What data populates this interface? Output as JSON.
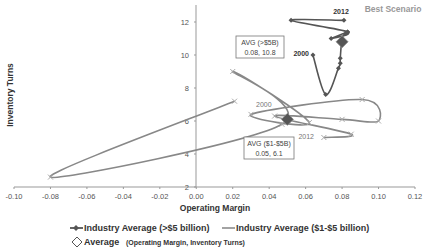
{
  "chart_data": {
    "type": "line",
    "title": "",
    "xlabel": "Operating Margin",
    "ylabel": "Inventory Turns",
    "xlim": [
      -0.1,
      0.12
    ],
    "ylim": [
      2,
      13
    ],
    "x_ticks": [
      "-0.10",
      "-0.08",
      "-0.06",
      "-0.04",
      "-0.02",
      "0.00",
      "0.02",
      "0.04",
      "0.06",
      "0.08",
      "0.10",
      "0.12"
    ],
    "y_ticks": [
      "2",
      "4",
      "6",
      "8",
      "10",
      "12"
    ],
    "grid": false,
    "legend_position": "bottom",
    "annotation_best": "Best Scenario",
    "series": [
      {
        "name": "Industry Average (>$5 billion)",
        "marker": "diamond-small",
        "color": "#555555",
        "start_label": "2000",
        "end_label": "2012",
        "points": [
          [
            0.064,
            10.0
          ],
          [
            0.071,
            7.6
          ],
          [
            0.078,
            9.2
          ],
          [
            0.079,
            9.5
          ],
          [
            0.079,
            9.8
          ],
          [
            0.08,
            11.0
          ],
          [
            0.082,
            11.3
          ],
          [
            0.083,
            11.4
          ],
          [
            0.074,
            11.0
          ],
          [
            0.083,
            11.4
          ],
          [
            0.052,
            12.1
          ],
          [
            0.081,
            12.1
          ]
        ]
      },
      {
        "name": "Industry Average ($1-$5 billion)",
        "marker": "x",
        "color": "#888888",
        "start_label": "2000",
        "end_label": "2012",
        "points": [
          [
            0.021,
            7.2
          ],
          [
            -0.08,
            2.6
          ],
          [
            0.047,
            5.8
          ],
          [
            0.02,
            9.0
          ],
          [
            0.062,
            5.9
          ],
          [
            0.03,
            6.4
          ],
          [
            0.091,
            7.3
          ],
          [
            0.1,
            6.0
          ],
          [
            0.08,
            6.1
          ],
          [
            0.043,
            6.3
          ],
          [
            0.085,
            5.2
          ],
          [
            0.07,
            5.0
          ]
        ]
      }
    ],
    "averages": [
      {
        "label": "AVG (>$5B)",
        "value_text": "0.08, 10.8",
        "x": 0.08,
        "y": 10.8
      },
      {
        "label": "AVG ($1-$5B)",
        "value_text": "0.05, 6.1",
        "x": 0.05,
        "y": 6.1
      }
    ],
    "legend": [
      {
        "label": "Industry Average (>$5 billion)"
      },
      {
        "label": "Industry Average ($1-$5 billion)"
      },
      {
        "label": "Average",
        "sublabel": "(Operating Margin, Inventory Turns)"
      }
    ]
  }
}
